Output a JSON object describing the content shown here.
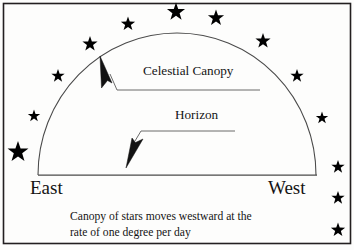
{
  "figure": {
    "name": "celestial-canopy-diagram",
    "frame_color": "#231f20",
    "background_color": "#fdfdfc",
    "line_color": "#3a3a3a",
    "star_color": "#000000",
    "text_color": "#141414"
  },
  "labels": {
    "celestial_canopy": "Celestial Canopy",
    "horizon": "Horizon",
    "east": "East",
    "west": "West"
  },
  "caption": {
    "line1": "Canopy of stars moves westward at the",
    "line2": "rate of one degree per day"
  },
  "chart_data": {
    "type": "diagram",
    "title": "Celestial Canopy",
    "dome": {
      "center_x": 177,
      "center_y": 175,
      "radius_x": 139,
      "radius_y": 142,
      "apex_y": 33
    },
    "horizon_line": {
      "x1": 38,
      "y1": 175,
      "x2": 317,
      "y2": 175
    },
    "annotations": [
      {
        "name": "celestial-canopy-callout",
        "text": "Celestial Canopy",
        "leader_x1": 260,
        "leader_y1": 90,
        "leader_x2": 117,
        "leader_y2": 90,
        "arrow_tip_x": 100,
        "arrow_tip_y": 56,
        "arrow_direction": "up-left"
      },
      {
        "name": "horizon-callout",
        "text": "Horizon",
        "leader_x1": 235,
        "leader_y1": 131,
        "leader_x2": 141,
        "leader_y2": 131,
        "arrow_tip_x": 126,
        "arrow_tip_y": 168,
        "arrow_direction": "down-left"
      }
    ],
    "stars": [
      {
        "cx": 176,
        "cy": 12,
        "r": 9.5
      },
      {
        "cx": 216,
        "cy": 18,
        "r": 8.5
      },
      {
        "cx": 128,
        "cy": 24,
        "r": 7.5
      },
      {
        "cx": 90,
        "cy": 44,
        "r": 8.0
      },
      {
        "cx": 263,
        "cy": 41,
        "r": 8.0
      },
      {
        "cx": 58,
        "cy": 76,
        "r": 7.0
      },
      {
        "cx": 297,
        "cy": 76,
        "r": 7.0
      },
      {
        "cx": 34,
        "cy": 116,
        "r": 6.5
      },
      {
        "cx": 322,
        "cy": 118,
        "r": 6.5
      },
      {
        "cx": 18,
        "cy": 152,
        "r": 11.0
      },
      {
        "cx": 338,
        "cy": 167,
        "r": 7.0
      },
      {
        "cx": 338,
        "cy": 198,
        "r": 7.0
      },
      {
        "cx": 338,
        "cy": 230,
        "r": 7.5
      }
    ]
  }
}
